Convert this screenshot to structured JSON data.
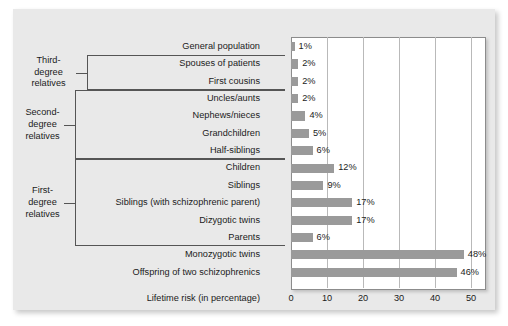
{
  "chart_data": {
    "type": "bar",
    "orientation": "horizontal",
    "title": "",
    "xlabel": "Lifetime risk (in percentage)",
    "ylabel": "",
    "xlim": [
      0,
      55
    ],
    "xticks": [
      0,
      10,
      20,
      30,
      40,
      50
    ],
    "grid": true,
    "legend": false,
    "unit_suffix": "%",
    "bar_color": "#9a9a9a",
    "panel_color": "#e9e9e9",
    "plot_background": "#ffffff",
    "categories": [
      "General population",
      "Spouses of patients",
      "First cousins",
      "Uncles/aunts",
      "Nephews/nieces",
      "Grandchildren",
      "Half-siblings",
      "Children",
      "Siblings",
      "Siblings (with schizophrenic parent)",
      "Dizygotic twins",
      "Parents",
      "Monozygotic twins",
      "Offspring of two schizophrenics"
    ],
    "values": [
      1,
      2,
      2,
      2,
      4,
      5,
      6,
      12,
      9,
      17,
      17,
      6,
      48,
      46
    ],
    "value_labels": [
      "1%",
      "2%",
      "2%",
      "2%",
      "4%",
      "5%",
      "6%",
      "12%",
      "9%",
      "17%",
      "17%",
      "6%",
      "48%",
      "46%"
    ],
    "groups": [
      {
        "label_lines": [
          "Third-",
          "degree",
          "relatives"
        ],
        "first_row": 1,
        "last_row": 2
      },
      {
        "label_lines": [
          "Second-",
          "degree",
          "relatives"
        ],
        "first_row": 3,
        "last_row": 6
      },
      {
        "label_lines": [
          "First-",
          "degree",
          "relatives"
        ],
        "first_row": 7,
        "last_row": 11
      }
    ]
  }
}
